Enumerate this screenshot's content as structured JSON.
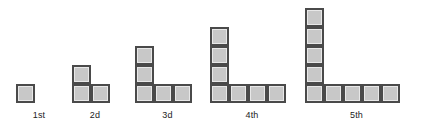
{
  "diagram": {
    "background_color": "#ffffff",
    "tile": {
      "fill_color": "#c8c8c8",
      "border_color": "#4a4a4a",
      "size_px": 19
    },
    "label_color": "#232323",
    "figures": [
      {
        "id": "figure-1",
        "label": "1st",
        "column_count": 1,
        "row_count": 1,
        "total_squares": 1,
        "left_px": 16,
        "label_left_px": 16,
        "label_width_px": 46
      },
      {
        "id": "figure-2",
        "label": "2d",
        "column_count": 2,
        "row_count": 2,
        "total_squares": 3,
        "left_px": 72,
        "label_left_px": 72,
        "label_width_px": 46
      },
      {
        "id": "figure-3",
        "label": "3d",
        "column_count": 3,
        "row_count": 3,
        "total_squares": 5,
        "left_px": 135,
        "label_left_px": 135,
        "label_width_px": 65
      },
      {
        "id": "figure-4",
        "label": "4th",
        "column_count": 4,
        "row_count": 4,
        "total_squares": 7,
        "left_px": 210,
        "label_left_px": 210,
        "label_width_px": 84
      },
      {
        "id": "figure-5",
        "label": "5th",
        "column_count": 5,
        "row_count": 5,
        "total_squares": 9,
        "left_px": 305,
        "label_left_px": 305,
        "label_width_px": 103
      }
    ]
  }
}
